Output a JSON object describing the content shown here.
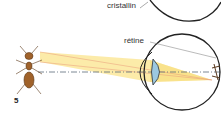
{
  "diagram": {
    "labels": {
      "lens": "cristallin",
      "retina": "rétine"
    },
    "figure_number": "5",
    "colors": {
      "light_cone": "#fbe89a",
      "lens_fill": "#9cc8e0",
      "eye_outline": "#222222",
      "axis_line": "#5a6a7a",
      "ant_body": "#a0622a",
      "ray_line": "#e89a7a"
    }
  }
}
